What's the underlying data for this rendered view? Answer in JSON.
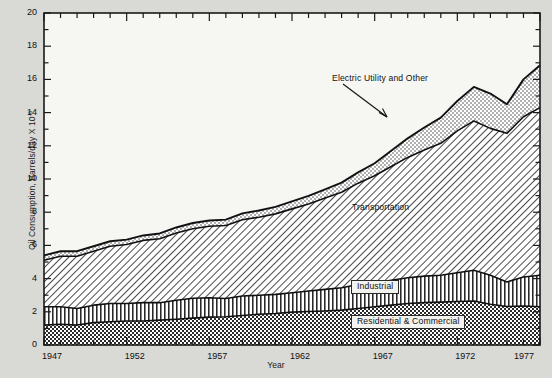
{
  "chart_data": {
    "type": "area",
    "title": "",
    "xlabel": "Year",
    "ylabel_text": "Oil Consumption, Barrels/day X 10",
    "ylabel_exponent": "-6",
    "xlim": [
      1947,
      1977
    ],
    "ylim": [
      0,
      20
    ],
    "y_ticks": [
      0,
      2,
      4,
      6,
      8,
      10,
      12,
      14,
      16,
      18,
      20
    ],
    "y_minor_step": 1,
    "x_ticks": [
      1947,
      1952,
      1957,
      1962,
      1967,
      1972,
      1977
    ],
    "x_minor_step": 1,
    "grid": false,
    "legend_position": "inline-annotations",
    "stacked": true,
    "x": [
      1947,
      1948,
      1949,
      1950,
      1951,
      1952,
      1953,
      1954,
      1955,
      1956,
      1957,
      1958,
      1959,
      1960,
      1961,
      1962,
      1963,
      1964,
      1965,
      1966,
      1967,
      1968,
      1969,
      1970,
      1971,
      1972,
      1973,
      1974,
      1975,
      1976,
      1977
    ],
    "series": [
      {
        "name": "Residential & Commercial",
        "pattern": "checkerboard",
        "values": [
          1.2,
          1.25,
          1.2,
          1.35,
          1.4,
          1.45,
          1.45,
          1.5,
          1.55,
          1.62,
          1.68,
          1.7,
          1.78,
          1.85,
          1.9,
          1.98,
          2.02,
          2.05,
          2.1,
          2.2,
          2.3,
          2.4,
          2.5,
          2.55,
          2.58,
          2.62,
          2.65,
          2.45,
          2.32,
          2.35,
          2.3
        ]
      },
      {
        "name": "Industrial",
        "pattern": "vertical-stripes",
        "values": [
          1.1,
          1.05,
          1.0,
          1.05,
          1.1,
          1.05,
          1.1,
          1.05,
          1.15,
          1.2,
          1.17,
          1.1,
          1.17,
          1.15,
          1.15,
          1.17,
          1.23,
          1.3,
          1.35,
          1.45,
          1.45,
          1.5,
          1.55,
          1.6,
          1.62,
          1.73,
          1.85,
          1.75,
          1.48,
          1.75,
          1.9
        ]
      },
      {
        "name": "Transportation",
        "pattern": "diagonal-hatch",
        "values": [
          2.8,
          3.05,
          3.15,
          3.25,
          3.45,
          3.55,
          3.75,
          3.85,
          4.05,
          4.18,
          4.3,
          4.4,
          4.6,
          4.7,
          4.85,
          5.05,
          5.25,
          5.5,
          5.75,
          6.1,
          6.45,
          6.85,
          7.25,
          7.6,
          7.95,
          8.55,
          9.0,
          8.85,
          8.95,
          9.65,
          10.1
        ]
      },
      {
        "name": "Electric Utility and Other",
        "pattern": "stipple",
        "values": [
          0.3,
          0.3,
          0.3,
          0.3,
          0.3,
          0.3,
          0.3,
          0.32,
          0.33,
          0.35,
          0.35,
          0.35,
          0.38,
          0.4,
          0.42,
          0.45,
          0.48,
          0.52,
          0.58,
          0.65,
          0.75,
          0.95,
          1.15,
          1.35,
          1.55,
          1.8,
          2.05,
          2.1,
          1.75,
          2.25,
          2.55
        ]
      }
    ],
    "totals": [
      5.4,
      5.65,
      5.65,
      5.95,
      6.25,
      6.35,
      6.6,
      6.72,
      7.08,
      7.35,
      7.5,
      7.55,
      7.93,
      8.1,
      8.32,
      8.65,
      8.98,
      9.37,
      9.78,
      10.4,
      10.95,
      11.7,
      12.45,
      13.1,
      13.7,
      14.7,
      15.55,
      15.15,
      14.5,
      15.99,
      16.85
    ]
  },
  "labels": {
    "electric_utility": "Electric Utility and Other",
    "transportation": "Transportation",
    "industrial": "Industrial",
    "residential": "Residential & Commercial"
  },
  "colors": {
    "background": "#d9d9d5",
    "plot_background": "#f6f6f3",
    "axis": "#1a1a1a",
    "line": "#111111"
  }
}
